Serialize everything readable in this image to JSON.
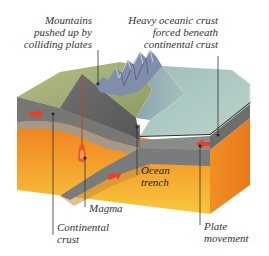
{
  "labels": {
    "mountains": "Mountains\npushed up by\ncolliding plates",
    "oceanic_crust": "Heavy oceanic crust\nforced beneath\ncontinental crust",
    "ocean_trench": "Ocean\ntrench",
    "magma": "Magma",
    "continental_crust": "Continental\ncrust",
    "plate_movement": "Plate\nmovement"
  },
  "colors": {
    "land_green": "#9fae72",
    "land_green_dark": "#7d8c57",
    "mountain_blue": "#7f8fab",
    "ocean_surface": "#a9c3bd",
    "ocean_shallow": "#8fb0ae",
    "crust_gray": "#6f706c",
    "crust_gray_light": "#8f918c",
    "oceanic_plate": "#7c7e7c",
    "mantle_orange": "#ef8a22",
    "mantle_yellow": "#f7c23a",
    "arrow_red": "#e8402a",
    "leader_line": "#333333"
  }
}
